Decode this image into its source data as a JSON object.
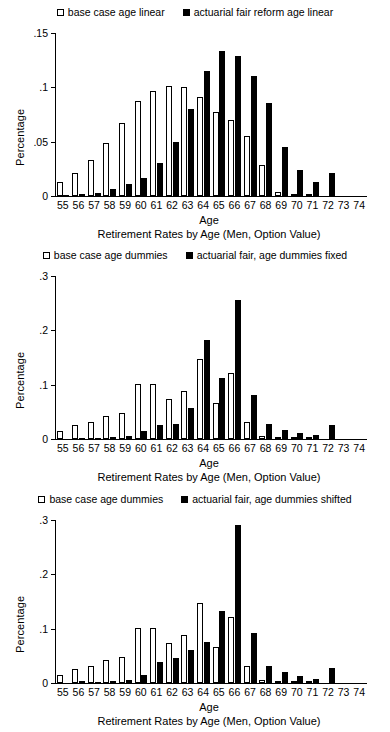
{
  "figure": {
    "background": "#ffffff",
    "open_color": "#ffffff",
    "filled_color": "#000000",
    "axis_color": "#000000"
  },
  "chart_data": [
    {
      "type": "bar",
      "title": "",
      "xlabel": "Age",
      "ylabel": "Percentage",
      "caption": "Retirement Rates by Age (Men, Option Value)",
      "categories": [
        "55",
        "56",
        "57",
        "58",
        "59",
        "60",
        "61",
        "62",
        "63",
        "64",
        "65",
        "66",
        "67",
        "68",
        "69",
        "70",
        "71",
        "72",
        "73",
        "74"
      ],
      "ylim": [
        0,
        0.15
      ],
      "yticks": [
        0,
        0.05,
        0.1,
        0.15
      ],
      "ytick_labels": [
        "0",
        ".05",
        ".1",
        ".15"
      ],
      "grid": false,
      "legend_position": "top",
      "series": [
        {
          "name": "base case age linear",
          "style": "open",
          "values": [
            0.013,
            0.021,
            0.033,
            0.049,
            0.067,
            0.087,
            0.097,
            0.101,
            0.1,
            0.091,
            0.077,
            0.07,
            0.055,
            0.029,
            0.004,
            0.002,
            0.001,
            0.0,
            0.0,
            0.0
          ]
        },
        {
          "name": "actuarial fair reform age linear",
          "style": "filled",
          "values": [
            0.001,
            0.002,
            0.003,
            0.006,
            0.011,
            0.017,
            0.03,
            0.05,
            0.08,
            0.115,
            0.133,
            0.129,
            0.11,
            0.086,
            0.045,
            0.024,
            0.013,
            0.021,
            0.0,
            0.0
          ]
        }
      ]
    },
    {
      "type": "bar",
      "title": "",
      "xlabel": "Age",
      "ylabel": "Percentage",
      "caption": "Retirement Rates by Age (Men, Option Value)",
      "categories": [
        "55",
        "56",
        "57",
        "58",
        "59",
        "60",
        "61",
        "62",
        "63",
        "64",
        "65",
        "66",
        "67",
        "68",
        "69",
        "70",
        "71",
        "72",
        "73",
        "74"
      ],
      "ylim": [
        0,
        0.3
      ],
      "yticks": [
        0,
        0.1,
        0.2,
        0.3
      ],
      "ytick_labels": [
        "0",
        ".1",
        ".2",
        ".3"
      ],
      "grid": false,
      "legend_position": "top",
      "series": [
        {
          "name": "base case age dummies",
          "style": "open",
          "values": [
            0.014,
            0.025,
            0.031,
            0.042,
            0.047,
            0.102,
            0.102,
            0.073,
            0.088,
            0.147,
            0.067,
            0.121,
            0.031,
            0.006,
            0.003,
            0.002,
            0.001,
            0.0,
            0.0,
            0.0
          ]
        },
        {
          "name": "actuarial fair, age dummies fixed",
          "style": "filled",
          "values": [
            0.0,
            0.002,
            0.001,
            0.004,
            0.005,
            0.015,
            0.025,
            0.027,
            0.057,
            0.183,
            0.113,
            0.256,
            0.081,
            0.027,
            0.017,
            0.011,
            0.007,
            0.026,
            0.0,
            0.0
          ]
        }
      ]
    },
    {
      "type": "bar",
      "title": "",
      "xlabel": "Age",
      "ylabel": "Percentage",
      "caption": "Retirement Rates by Age (Men, Option Value)",
      "categories": [
        "55",
        "56",
        "57",
        "58",
        "59",
        "60",
        "61",
        "62",
        "63",
        "64",
        "65",
        "66",
        "67",
        "68",
        "69",
        "70",
        "71",
        "72",
        "73",
        "74"
      ],
      "ylim": [
        0,
        0.3
      ],
      "yticks": [
        0,
        0.1,
        0.2,
        0.3
      ],
      "ytick_labels": [
        "0",
        ".1",
        ".2",
        ".3"
      ],
      "grid": false,
      "legend_position": "top",
      "series": [
        {
          "name": "base case age dummies",
          "style": "open",
          "values": [
            0.014,
            0.025,
            0.031,
            0.042,
            0.047,
            0.102,
            0.102,
            0.073,
            0.088,
            0.147,
            0.067,
            0.121,
            0.031,
            0.006,
            0.003,
            0.002,
            0.001,
            0.0,
            0.0,
            0.0
          ]
        },
        {
          "name": "actuarial fair, age dummies shifted",
          "style": "filled",
          "values": [
            0.0,
            0.003,
            0.002,
            0.003,
            0.005,
            0.015,
            0.038,
            0.046,
            0.06,
            0.076,
            0.133,
            0.291,
            0.092,
            0.031,
            0.02,
            0.013,
            0.008,
            0.027,
            0.0,
            0.0
          ]
        }
      ]
    }
  ]
}
